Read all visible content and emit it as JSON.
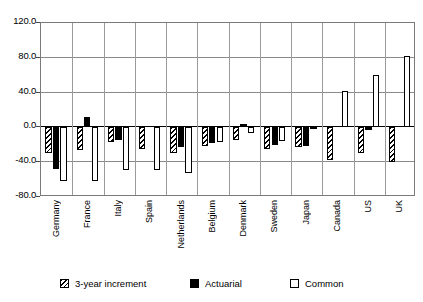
{
  "chart_data": {
    "type": "bar",
    "title": "",
    "subtitle": "",
    "xlabel": "",
    "ylabel": "",
    "ylim": [
      -80.0,
      120.0
    ],
    "ytick_labels": [
      "120.0",
      "80.0",
      "40.0",
      "0.0",
      "-40.0",
      "-80.0"
    ],
    "yticks": [
      120.0,
      80.0,
      40.0,
      0.0,
      -40.0,
      -80.0
    ],
    "grid": true,
    "legend_position": "bottom",
    "categories": [
      "Germany",
      "France",
      "Italy",
      "Spain",
      "Netherlands",
      "Belgium",
      "Denmark",
      "Sweden",
      "Japan",
      "Canada",
      "US",
      "UK"
    ],
    "series": [
      {
        "name": "3-year increment",
        "style": "hatched",
        "values": [
          -30,
          -26,
          -17,
          -25,
          -30,
          -21,
          -14,
          -25,
          -22,
          -38,
          -30,
          -40
        ]
      },
      {
        "name": "Actuarial",
        "style": "black",
        "values": [
          -48,
          12,
          -14,
          0,
          -23,
          -18,
          4,
          -20,
          -21,
          0,
          -3,
          0
        ]
      },
      {
        "name": "Common",
        "style": "white",
        "values": [
          -62,
          -62,
          -49,
          -49,
          -52,
          -17,
          -6,
          -16,
          -2,
          42,
          60,
          82
        ]
      }
    ]
  },
  "legend": {
    "items": [
      {
        "label": "3-year increment",
        "style": "hatched"
      },
      {
        "label": "Actuarial",
        "style": "black"
      },
      {
        "label": "Common",
        "style": "white"
      }
    ]
  },
  "colors": {
    "axis": "#000000",
    "grid": "#8a8a8a",
    "frame": "#7a7a7a",
    "bar_outline": "#000000",
    "background": "#ffffff"
  }
}
